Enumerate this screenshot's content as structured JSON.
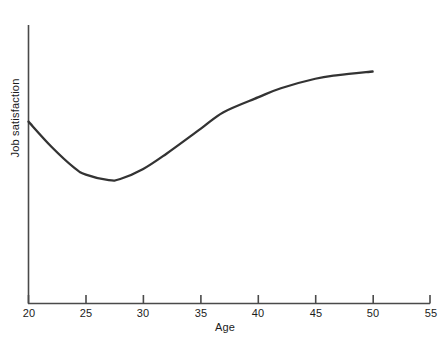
{
  "chart_data": {
    "type": "line",
    "title": "",
    "subtitle": "",
    "xlabel": "Age",
    "ylabel": "Job satisfaction",
    "grid": false,
    "legend": null,
    "xlim": [
      20,
      55
    ],
    "ylim": [
      0,
      1
    ],
    "xticks": [
      20,
      25,
      30,
      35,
      40,
      45,
      50,
      55
    ],
    "xtick_labels": [
      "20",
      "25",
      "30",
      "35",
      "40",
      "45",
      "50",
      "55"
    ],
    "yticks": [],
    "ytick_labels": [],
    "annotations": [],
    "series": [
      {
        "name": "Job satisfaction",
        "color": "#333333",
        "x": [
          20,
          22,
          24,
          25,
          27,
          28,
          30,
          32,
          35,
          37,
          40,
          42,
          45,
          47,
          50
        ],
        "y": [
          0.653,
          0.563,
          0.487,
          0.463,
          0.443,
          0.447,
          0.483,
          0.537,
          0.627,
          0.687,
          0.74,
          0.773,
          0.807,
          0.82,
          0.833
        ]
      }
    ]
  },
  "axes": {
    "x_axis_label": "Age",
    "y_axis_label": "Job satisfaction",
    "x_tick_values": [
      "20",
      "25",
      "30",
      "35",
      "40",
      "45",
      "50",
      "55"
    ]
  },
  "colors": {
    "curve": "#333333",
    "axis": "#4a4a4a",
    "text": "#1c1c1c",
    "background": "#ffffff"
  }
}
